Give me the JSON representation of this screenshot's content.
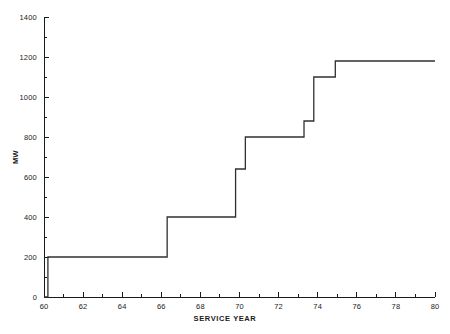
{
  "chart_data": {
    "type": "line",
    "subtype": "step",
    "title": "",
    "xlabel": "SERVICE YEAR",
    "ylabel": "MW",
    "xlim": [
      60,
      80
    ],
    "ylim": [
      0,
      1400
    ],
    "grid": false,
    "legend": null,
    "x_ticks_major": [
      60,
      62,
      64,
      66,
      68,
      70,
      72,
      74,
      76,
      78,
      80
    ],
    "x_ticks_minor": [
      61,
      63,
      65,
      67,
      69,
      71,
      73,
      75,
      77,
      79
    ],
    "x_tick_labels": [
      "60",
      "62",
      "64",
      "66",
      "68",
      "70",
      "72",
      "74",
      "76",
      "78",
      "80"
    ],
    "y_ticks_major": [
      0,
      200,
      400,
      600,
      800,
      1000,
      1200,
      1400
    ],
    "y_ticks_minor": [
      100,
      300,
      500,
      700,
      900,
      1100,
      1300
    ],
    "y_tick_labels": [
      "0",
      "200",
      "400",
      "600",
      "800",
      "1000",
      "1200",
      "1400"
    ],
    "series": [
      {
        "name": "Installed capacity",
        "color": "#303030",
        "steps": [
          {
            "x": 60.0,
            "y": 0
          },
          {
            "x": 60.2,
            "y": 0
          },
          {
            "x": 60.2,
            "y": 200
          },
          {
            "x": 66.3,
            "y": 200
          },
          {
            "x": 66.3,
            "y": 400
          },
          {
            "x": 69.8,
            "y": 400
          },
          {
            "x": 69.8,
            "y": 640
          },
          {
            "x": 70.3,
            "y": 640
          },
          {
            "x": 70.3,
            "y": 800
          },
          {
            "x": 73.3,
            "y": 800
          },
          {
            "x": 73.3,
            "y": 880
          },
          {
            "x": 73.8,
            "y": 880
          },
          {
            "x": 73.8,
            "y": 1100
          },
          {
            "x": 74.9,
            "y": 1100
          },
          {
            "x": 74.9,
            "y": 1180
          },
          {
            "x": 80.0,
            "y": 1180
          }
        ],
        "plateaus": [
          {
            "from_year": 60.2,
            "to_year": 66.3,
            "value": 200
          },
          {
            "from_year": 66.3,
            "to_year": 69.8,
            "value": 400
          },
          {
            "from_year": 69.8,
            "to_year": 70.3,
            "value": 640
          },
          {
            "from_year": 70.3,
            "to_year": 73.3,
            "value": 800
          },
          {
            "from_year": 73.3,
            "to_year": 73.8,
            "value": 880
          },
          {
            "from_year": 73.8,
            "to_year": 74.9,
            "value": 1100
          },
          {
            "from_year": 74.9,
            "to_year": 80.0,
            "value": 1180
          }
        ]
      }
    ]
  },
  "axes": {
    "x_title": "SERVICE YEAR",
    "y_title": "MW"
  },
  "colors": {
    "line": "#303030",
    "axis": "#1a1a1a",
    "background": "#ffffff"
  }
}
